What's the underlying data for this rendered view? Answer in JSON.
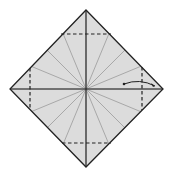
{
  "diagram": {
    "type": "origami-fold-diagram",
    "background": "#ffffff",
    "paper_fill": "#dcdcdc",
    "edge_color": "#222222",
    "crease_color": "#9a9a9a",
    "dash_color": "#222222",
    "square": {
      "top": [
        86,
        10
      ],
      "right": [
        163,
        89
      ],
      "bottom": [
        86,
        167
      ],
      "left": [
        10,
        89
      ]
    },
    "center": [
      86,
      89
    ],
    "radial_creases": 16,
    "dashed_folds": [
      {
        "name": "top-fold",
        "x1": 61,
        "y1": 34,
        "x2": 111,
        "y2": 34
      },
      {
        "name": "bottom-fold",
        "x1": 62,
        "y1": 143,
        "x2": 111,
        "y2": 143
      },
      {
        "name": "left-fold",
        "x1": 30,
        "y1": 68,
        "x2": 30,
        "y2": 109
      },
      {
        "name": "right-fold",
        "x1": 142,
        "y1": 67,
        "x2": 142,
        "y2": 110
      }
    ],
    "arrow": {
      "name": "fold-arrow",
      "from": [
        124,
        84
      ],
      "to": [
        155,
        86
      ]
    }
  }
}
